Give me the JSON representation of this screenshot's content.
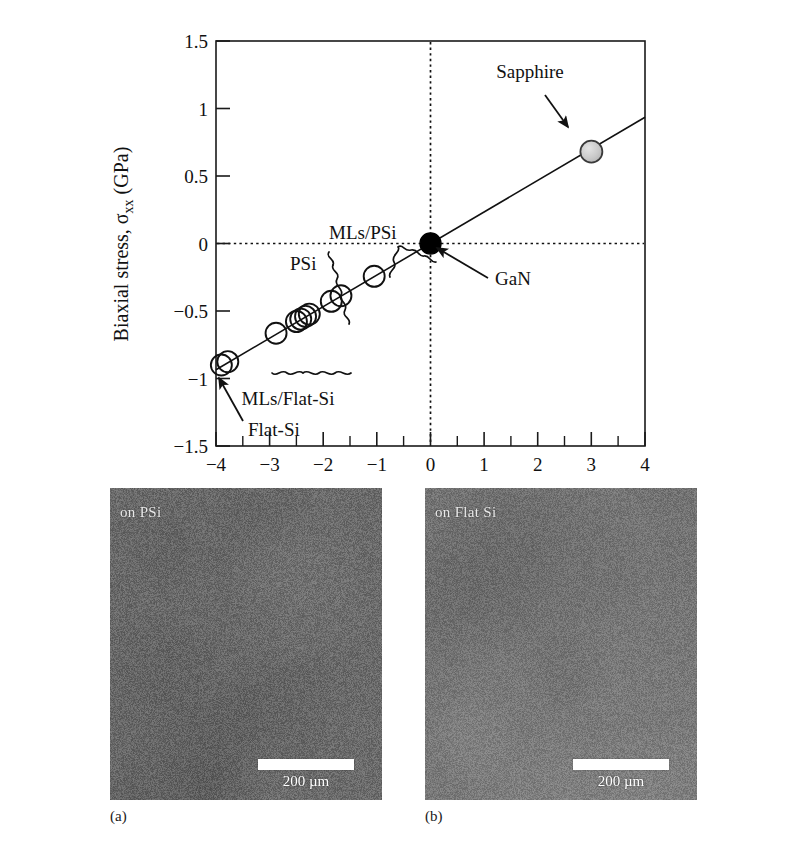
{
  "chart_data": {
    "type": "scatter",
    "title": "",
    "xlabel": "Raman shift, Δω (cm⁻¹)",
    "ylabel": "Biaxial stress, σxx (GPa)",
    "xlim": [
      -4,
      4
    ],
    "ylim": [
      -1.5,
      1.5
    ],
    "x_ticks": [
      -4,
      -3,
      -2,
      -1,
      0,
      1,
      2,
      3,
      4
    ],
    "x_tick_labels": [
      "−4",
      "−3",
      "−2",
      "−1",
      "0",
      "1",
      "2",
      "3",
      "4"
    ],
    "x_minor_tick_step": 0.5,
    "y_ticks": [
      -1.5,
      -1,
      -0.5,
      0,
      0.5,
      1,
      1.5
    ],
    "y_tick_labels": [
      "−1.5",
      "−1",
      "−0.5",
      "0",
      "0.5",
      "1",
      "1.5"
    ],
    "grid": false,
    "legend": "none",
    "reference_lines": [
      {
        "name": "zero-stress-line",
        "orientation": "horizontal",
        "value": 0,
        "style": "dotted"
      },
      {
        "name": "zero-shift-line",
        "orientation": "vertical",
        "value": 0,
        "style": "dotted"
      }
    ],
    "fit_line": {
      "name": "stress-shift-calibration-line",
      "slope": 0.2314,
      "intercept": 0.0,
      "x_from": -4,
      "x_to": 4,
      "style": "solid"
    },
    "series": [
      {
        "name": "Flat-Si",
        "marker": "open-circle",
        "points": [
          {
            "x": -3.9,
            "y": -0.9
          },
          {
            "x": -3.78,
            "y": -0.875
          }
        ]
      },
      {
        "name": "MLs/Flat-Si",
        "marker": "open-circle",
        "points": [
          {
            "x": -2.88,
            "y": -0.665
          },
          {
            "x": -2.5,
            "y": -0.578
          },
          {
            "x": -2.42,
            "y": -0.56
          },
          {
            "x": -2.33,
            "y": -0.54
          },
          {
            "x": -2.26,
            "y": -0.523
          }
        ]
      },
      {
        "name": "PSi",
        "marker": "open-circle",
        "points": [
          {
            "x": -2.42,
            "y": -0.56
          },
          {
            "x": -2.33,
            "y": -0.54
          },
          {
            "x": -2.26,
            "y": -0.523
          }
        ]
      },
      {
        "name": "MLs/PSi",
        "marker": "open-circle",
        "points": [
          {
            "x": -1.85,
            "y": -0.428
          },
          {
            "x": -1.67,
            "y": -0.387
          },
          {
            "x": -1.05,
            "y": -0.243
          }
        ]
      },
      {
        "name": "GaN",
        "marker": "filled-circle-black",
        "color": "#000000",
        "points": [
          {
            "x": 0,
            "y": 0
          }
        ]
      },
      {
        "name": "Sapphire",
        "marker": "filled-circle-gray",
        "color": "#c9c9c9",
        "points": [
          {
            "x": 3,
            "y": 0.68
          }
        ]
      }
    ],
    "annotations": [
      {
        "name": "sapphire-label",
        "text": "Sapphire",
        "x": 2.08,
        "y": 1.18,
        "arrow_to": {
          "x": 2.86,
          "y": 0.74
        }
      },
      {
        "name": "gan-label",
        "text": "GaN",
        "x": 0.72,
        "y": -0.27,
        "arrow_to": {
          "x": 0.1,
          "y": -0.02
        }
      },
      {
        "name": "flat-si-label",
        "text": "Flat-Si",
        "x": -3.62,
        "y": -1.33,
        "arrow_to": {
          "x": -3.86,
          "y": -0.97
        }
      },
      {
        "name": "psi-brace-label",
        "text": "PSi",
        "x": -2.96,
        "y": -0.2,
        "brace": "above"
      },
      {
        "name": "mls-psi-brace-label",
        "text": "MLs/PSi",
        "x": -1.72,
        "y": 0.08,
        "brace": "above"
      },
      {
        "name": "mls-flat-si-brace-label",
        "text": "MLs/Flat-Si",
        "x": -2.1,
        "y": -1.05,
        "brace": "below"
      }
    ]
  },
  "chart": {
    "ylabel": "Biaxial stress, σ",
    "ylabel_sub": "xx",
    "ylabel_unit": " (GPa)",
    "xlabel_main": "Raman shift, Δω (cm",
    "xlabel_sup": "−1",
    "xlabel_end": ")"
  },
  "micrographs": {
    "panels": [
      {
        "id": "panel-a",
        "label": "on PSi",
        "scalebar_text": "200 µm",
        "caption": "(a)",
        "base_color": "#6b6b6b"
      },
      {
        "id": "panel-b",
        "label": "on Flat Si",
        "scalebar_text": "200 µm",
        "caption": "(b)",
        "base_color": "#787878"
      }
    ]
  },
  "colors": {
    "axis": "#1a1a1a",
    "sapphire_marker": "#c9c9c9",
    "gan_marker": "#000000",
    "open_marker_stroke": "#111111",
    "scalebar": "#ffffff"
  }
}
